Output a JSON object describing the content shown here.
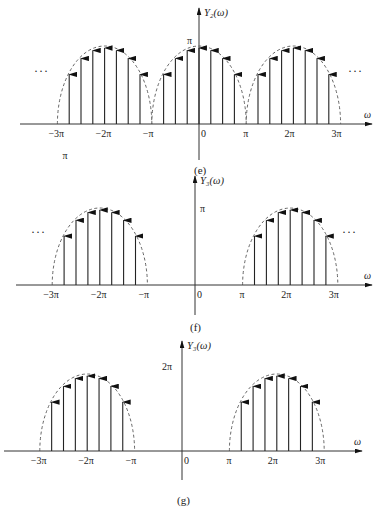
{
  "chart_data": [
    {
      "type": "impulse",
      "caption": "(e)",
      "ylabel": "Y₂(ω)",
      "xlabel": "ω",
      "ytick_label": "π",
      "extra_label": "π",
      "xticks": [
        "−3π",
        "−2π",
        "−π",
        "0",
        "π",
        "2π",
        "3π"
      ],
      "periodic": true,
      "ellipsis": "···",
      "lobes": [
        {
          "center_pi": -2,
          "halfwidth_pi": 1
        },
        {
          "center_pi": 0,
          "halfwidth_pi": 1
        },
        {
          "center_pi": 2,
          "halfwidth_pi": 1
        }
      ],
      "impulse_offsets_pi": [
        -0.75,
        -0.5,
        -0.25,
        0,
        0.25,
        0.5,
        0.75
      ],
      "envelope": "semicircle-like dashed",
      "peak_value": "π"
    },
    {
      "type": "impulse",
      "caption": "(f)",
      "ylabel": "Y₃(ω)",
      "xlabel": "ω",
      "ytick_label": "π",
      "xticks": [
        "−3π",
        "−2π",
        "−π",
        "0",
        "π",
        "2π",
        "3π"
      ],
      "periodic": true,
      "ellipsis": "···",
      "lobes": [
        {
          "center_pi": -2,
          "halfwidth_pi": 1
        },
        {
          "center_pi": 2,
          "halfwidth_pi": 1
        }
      ],
      "impulse_offsets_pi": [
        -0.75,
        -0.5,
        -0.25,
        0,
        0.25,
        0.5,
        0.75
      ],
      "envelope": "semicircle-like dashed",
      "peak_value": "π"
    },
    {
      "type": "impulse",
      "caption": "(g)",
      "ylabel": "Y₃(ω)",
      "xlabel": "ω",
      "ytick_label": "2π",
      "xticks": [
        "−3π",
        "−2π",
        "−π",
        "0",
        "π",
        "2π",
        "3π"
      ],
      "periodic": false,
      "lobes": [
        {
          "center_pi": -2,
          "halfwidth_pi": 1
        },
        {
          "center_pi": 2,
          "halfwidth_pi": 1
        }
      ],
      "impulse_offsets_pi": [
        -0.75,
        -0.5,
        -0.25,
        0,
        0.25,
        0.5,
        0.75
      ],
      "envelope": "semicircle-like dashed",
      "peak_value": "2π"
    }
  ],
  "layout": {
    "panels": [
      {
        "top": 0,
        "axisY": 124,
        "originX": 199,
        "pi": 47.2,
        "peak": 78,
        "yTop": 8,
        "yBottom": 160,
        "xLeft": 20,
        "xRight": 372
      },
      {
        "top": 0,
        "axisY": 285,
        "originX": 195,
        "pi": 47.6,
        "peak": 77,
        "yTop": 176,
        "yBottom": 315,
        "xLeft": 16,
        "xRight": 372
      },
      {
        "top": 0,
        "axisY": 451,
        "originX": 182,
        "pi": 47.4,
        "peak": 77,
        "yTop": 341,
        "yBottom": 480,
        "xLeft": 4,
        "xRight": 362
      }
    ]
  }
}
